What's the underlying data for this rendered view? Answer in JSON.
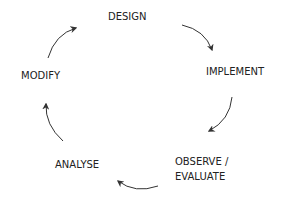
{
  "diagram": {
    "type": "cycle",
    "direction": "clockwise",
    "stages": [
      {
        "id": "design",
        "label": "DESIGN"
      },
      {
        "id": "implement",
        "label": "IMPLEMENT"
      },
      {
        "id": "observe",
        "label_line1": "OBSERVE /",
        "label_line2": "EVALUATE"
      },
      {
        "id": "analyse",
        "label": "ANALYSE"
      },
      {
        "id": "modify",
        "label": "MODIFY"
      }
    ],
    "edges": [
      {
        "from": "design",
        "to": "implement"
      },
      {
        "from": "implement",
        "to": "observe"
      },
      {
        "from": "observe",
        "to": "analyse"
      },
      {
        "from": "analyse",
        "to": "modify"
      },
      {
        "from": "modify",
        "to": "design"
      }
    ],
    "colors": {
      "text": "#222222",
      "arrow": "#333333",
      "background": "#ffffff"
    }
  }
}
